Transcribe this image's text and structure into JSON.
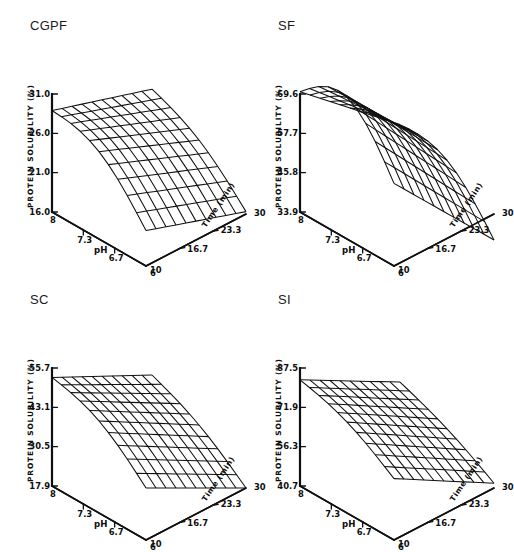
{
  "figure": {
    "background": "#ffffff",
    "ink": "#101010",
    "panel_count": 4
  },
  "common": {
    "zlabel": "PROTEIN SOLUBILITY (%)",
    "xlabel": "pH",
    "tlabel": "Time (min)",
    "xticks": [
      "8",
      "7.3",
      "6.7",
      "6"
    ],
    "tticks": [
      "10",
      "16.7",
      "23.3",
      "30"
    ],
    "x_range": [
      8,
      6
    ],
    "t_range": [
      10,
      30
    ],
    "mesh_rows": 10,
    "mesh_cols": 10
  },
  "chart_data": [
    {
      "type": "surface",
      "title": "CGPF",
      "xlabel": "pH",
      "ylabel": "Time (min)",
      "zlabel": "PROTEIN SOLUBILITY (%)",
      "xticks": [
        "8",
        "7.3",
        "6.7",
        "6"
      ],
      "yticks": [
        "10",
        "16.7",
        "23.3",
        "30"
      ],
      "zticks": [
        "16.0",
        "21.0",
        "26.0",
        "31.0"
      ],
      "zlim": [
        16.0,
        31.0
      ],
      "xlim": [
        8,
        6
      ],
      "ylim": [
        10,
        30
      ],
      "grid": true,
      "legend": "none",
      "surface_model": {
        "z00": 0.86,
        "z01": 0.3,
        "z10": 0.6,
        "z11": 0.02,
        "curve": 0.16
      },
      "note": "Solubility highest at pH 8 / short time; decreases toward pH 6 and longer time"
    },
    {
      "type": "surface",
      "title": "SF",
      "xlabel": "pH",
      "ylabel": "Time (min)",
      "zlabel": "PROTEIN SOLUBILITY (%)",
      "xticks": [
        "8",
        "7.3",
        "6.7",
        "6"
      ],
      "yticks": [
        "10",
        "16.7",
        "23.3",
        "30"
      ],
      "zticks": [
        "33.9",
        "45.8",
        "57.7",
        "69.6"
      ],
      "zlim": [
        33.9,
        69.6
      ],
      "xlim": [
        8,
        6
      ],
      "ylim": [
        10,
        30
      ],
      "grid": true,
      "legend": "none",
      "surface_model": {
        "z00": 1.02,
        "z01": 0.7,
        "z10": 0.3,
        "z11": -0.22,
        "curve": 0.34
      },
      "note": "Steeply curved surface, maximum near pH 8, strong decline toward pH 6"
    },
    {
      "type": "surface",
      "title": "SC",
      "xlabel": "pH",
      "ylabel": "Time (min)",
      "zlabel": "PROTEIN SOLUBILITY (%)",
      "xticks": [
        "8",
        "7.3",
        "6.7",
        "6"
      ],
      "yticks": [
        "10",
        "16.7",
        "23.3",
        "30"
      ],
      "zticks": [
        "17.9",
        "30.5",
        "43.1",
        "55.7"
      ],
      "zlim": [
        17.9,
        55.7
      ],
      "xlim": [
        8,
        6
      ],
      "ylim": [
        10,
        30
      ],
      "grid": true,
      "legend": "none",
      "surface_model": {
        "z00": 0.92,
        "z01": 0.44,
        "z10": 0.5,
        "z11": 0.0,
        "curve": 0.1
      },
      "note": "Near-planar tilted surface declining from pH 8 toward pH 6"
    },
    {
      "type": "surface",
      "title": "SI",
      "xlabel": "pH",
      "ylabel": "Time (min)",
      "zlabel": "PROTEIN SOLUBILITY (%)",
      "xticks": [
        "8",
        "7.3",
        "6.7",
        "6"
      ],
      "yticks": [
        "10",
        "16.7",
        "23.3",
        "30"
      ],
      "zticks": [
        "40.7",
        "56.3",
        "71.9",
        "87.5"
      ],
      "zlim": [
        40.7,
        87.5
      ],
      "xlim": [
        8,
        6
      ],
      "ylim": [
        10,
        30
      ],
      "grid": true,
      "legend": "none",
      "surface_model": {
        "z00": 0.9,
        "z01": 0.52,
        "z10": 0.44,
        "z11": 0.04,
        "curve": 0.06
      },
      "note": "Flat tilted plane, highest at pH 8 short time"
    }
  ]
}
